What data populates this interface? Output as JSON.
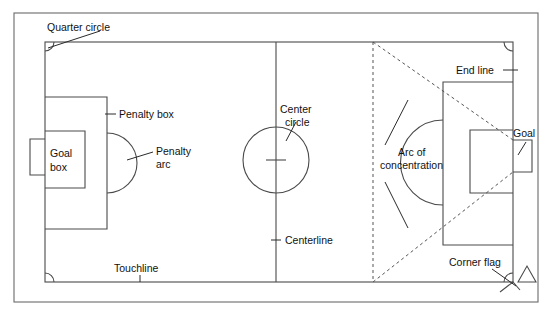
{
  "diagram": {
    "type": "field-diagram",
    "stroke_color": "#4a4a4a",
    "frame_color": "#6a6a6a",
    "dash_color": "#555555",
    "text_color": "#111111",
    "background": "#ffffff"
  },
  "labels": {
    "quarter_circle": "Quarter circle",
    "penalty_box": "Penalty box",
    "penalty_arc_line1": "Penalty",
    "penalty_arc_line2": "arc",
    "goal_box_line1": "Goal",
    "goal_box_line2": "box",
    "center_circle_line1": "Center",
    "center_circle_line2": "circle",
    "centerline": "Centerline",
    "touchline": "Touchline",
    "arc_of_concentration_line1": "Arc of",
    "arc_of_concentration_line2": "concentration",
    "end_line": "End line",
    "goal": "Goal",
    "corner_flag": "Corner flag"
  },
  "geometry": {
    "outer_frame": {
      "x": 14,
      "y": 13,
      "width": 524,
      "height": 289
    },
    "field": {
      "x": 45,
      "y": 42,
      "width": 468,
      "height": 240
    },
    "centerline_x": 276,
    "center_circle": {
      "cx": 276,
      "cy": 160,
      "r": 33
    },
    "center_mark": {
      "x": 276,
      "y": 160
    },
    "left_penalty_box": {
      "x": 45,
      "y": 97,
      "width": 62,
      "height": 132
    },
    "left_goal_box": {
      "x": 45,
      "y": 131,
      "width": 40,
      "height": 57
    },
    "left_goal": {
      "x": 30,
      "y": 139,
      "width": 15,
      "height": 36
    },
    "right_penalty_box": {
      "x": 443,
      "y": 82,
      "width": 70,
      "height": 163
    },
    "right_goal_box": {
      "x": 470,
      "y": 130,
      "width": 43,
      "height": 63
    },
    "right_goal": {
      "x": 513,
      "y": 140,
      "width": 19,
      "height": 32
    },
    "dashed_vertical_x": 373,
    "corner_arc_radius": 9,
    "corner_flag": {
      "x": 518,
      "y": 282
    }
  }
}
